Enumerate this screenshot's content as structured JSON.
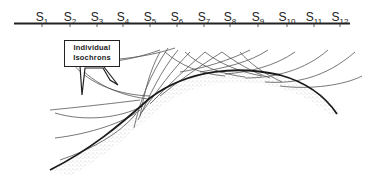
{
  "diagram": {
    "stations": [
      {
        "label": "S",
        "sub": "1",
        "x": 42
      },
      {
        "label": "S",
        "sub": "2",
        "x": 70
      },
      {
        "label": "S",
        "sub": "3",
        "x": 97
      },
      {
        "label": "S",
        "sub": "4",
        "x": 123
      },
      {
        "label": "S",
        "sub": "5",
        "x": 150
      },
      {
        "label": "S",
        "sub": "6",
        "x": 177
      },
      {
        "label": "S",
        "sub": "7",
        "x": 204
      },
      {
        "label": "S",
        "sub": "8",
        "x": 230
      },
      {
        "label": "S",
        "sub": "9",
        "x": 258
      },
      {
        "label": "S",
        "sub": "10",
        "x": 287
      },
      {
        "label": "S",
        "sub": "11",
        "x": 314
      },
      {
        "label": "S",
        "sub": "12",
        "x": 340
      }
    ],
    "callout": {
      "line1": "Individual",
      "line2": "Isochrons"
    },
    "colors": {
      "line": "#222222",
      "isochron": "#555555",
      "stipple": "#888888"
    }
  }
}
